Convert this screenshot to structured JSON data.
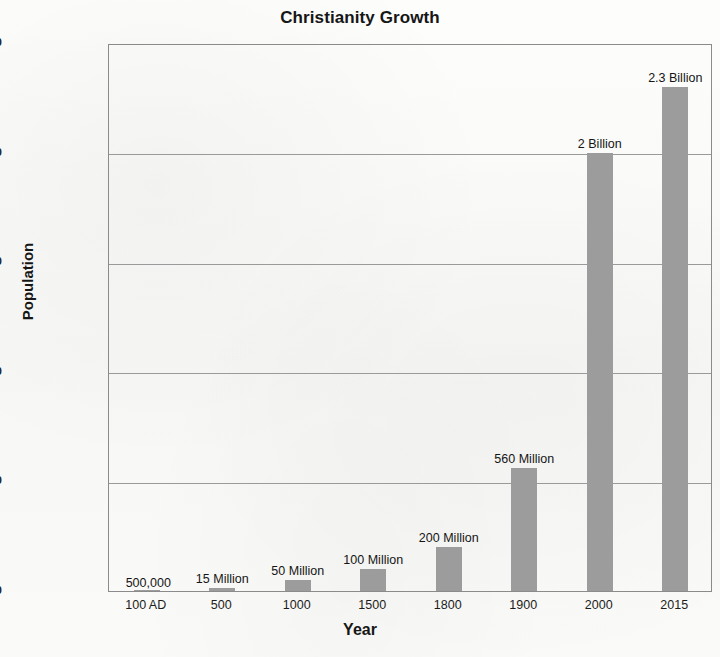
{
  "chart_data": {
    "type": "bar",
    "title": "Christianity Growth",
    "xlabel": "Year",
    "ylabel": "Population",
    "grid": true,
    "legend": "none",
    "categories": [
      "100 AD",
      "500",
      "1000",
      "1500",
      "1800",
      "1900",
      "2000",
      "2015"
    ],
    "values": [
      500000,
      15000000,
      50000000,
      100000000,
      200000000,
      560000000,
      2000000000,
      2300000000
    ],
    "data_labels": [
      "500,000",
      "15 Million",
      "50 Million",
      "100 Million",
      "200 Million",
      "560 Million",
      "2 Billion",
      "2.3 Billion"
    ],
    "ylim": [
      500000,
      2500500000
    ],
    "ytick_values": [
      500000,
      500500000,
      1000500000,
      1500500000,
      2000500000,
      2500500000
    ],
    "ytick_labels": [
      "500,000",
      "500,500,000",
      "1,000,500,000",
      "1,500,500,000",
      "2,000,500,000",
      "2,500,500,000"
    ],
    "bar_color": "#9c9c9c",
    "axis_color": "#8b8b8b",
    "grid_color": "#9a9a9a",
    "background_color": "#fbfbfa",
    "text_color": "#1b1b1b"
  }
}
